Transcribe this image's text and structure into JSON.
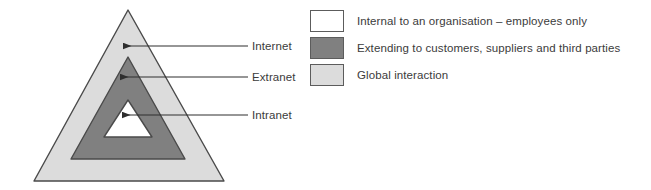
{
  "diagram": {
    "type": "nested-triangle",
    "title": "",
    "colors": {
      "outer_fill": "#dcdcdc",
      "middle_fill": "#808080",
      "inner_fill": "#ffffff",
      "stroke": "#4a4a4a",
      "text": "#3b3b3b",
      "arrow": "#2e2e2e"
    },
    "layers": [
      {
        "id": "internet",
        "label": "Internet",
        "fill": "#dcdcdc",
        "callout_arrow": true
      },
      {
        "id": "extranet",
        "label": "Extranet",
        "fill": "#808080",
        "callout_arrow": true
      },
      {
        "id": "intranet",
        "label": "Intranet",
        "fill": "#ffffff",
        "callout_arrow": true
      }
    ]
  },
  "legend": {
    "items": [
      {
        "swatch": "#ffffff",
        "text": "Internal to an organisation – employees only"
      },
      {
        "swatch": "#808080",
        "text": "Extending to customers, suppliers and third parties"
      },
      {
        "swatch": "#dcdcdc",
        "text": "Global interaction"
      }
    ]
  }
}
